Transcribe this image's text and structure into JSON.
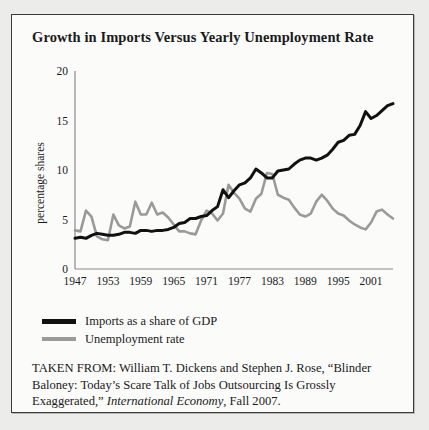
{
  "figure": {
    "title": "Growth in Imports Versus Yearly Unemployment Rate",
    "frame_border_color": "#3a3a3c",
    "background_color": "#fbfbfa",
    "page_background_color": "#ececea"
  },
  "legend": {
    "position": "below-plot",
    "items": [
      {
        "label": "Imports as a share of GDP",
        "color": "#111111",
        "style": "thick"
      },
      {
        "label": "Unemployment rate",
        "color": "#9a9a9a",
        "style": "normal"
      }
    ]
  },
  "source_note": {
    "prefix": "TAKEN FROM: William T. Dickens and Stephen J. Rose, “Blinder Baloney: Today’s Scare Talk of Jobs Outsourcing Is Grossly Exaggerated,” ",
    "italic": "International Economy",
    "suffix": ", Fall 2007."
  },
  "chart_data": {
    "type": "line",
    "title": "Growth in Imports Versus Yearly Unemployment Rate",
    "xlabel": "",
    "ylabel": "percentage shares",
    "xlim": [
      1947,
      2005
    ],
    "ylim": [
      0,
      20
    ],
    "yticks": [
      0,
      5,
      10,
      15,
      20
    ],
    "ytick_labels": [
      "0",
      "5",
      "10",
      "15",
      "20"
    ],
    "xticks": [
      1947,
      1953,
      1959,
      1965,
      1971,
      1977,
      1983,
      1989,
      1995,
      2001
    ],
    "xtick_labels": [
      "1947",
      "1953",
      "1959",
      "1965",
      "1971",
      "1977",
      "1983",
      "1989",
      "1995",
      "2001"
    ],
    "grid": false,
    "legend_position": "below",
    "x": [
      1947,
      1948,
      1949,
      1950,
      1951,
      1952,
      1953,
      1954,
      1955,
      1956,
      1957,
      1958,
      1959,
      1960,
      1961,
      1962,
      1963,
      1964,
      1965,
      1966,
      1967,
      1968,
      1969,
      1970,
      1971,
      1972,
      1973,
      1974,
      1975,
      1976,
      1977,
      1978,
      1979,
      1980,
      1981,
      1982,
      1983,
      1984,
      1985,
      1986,
      1987,
      1988,
      1989,
      1990,
      1991,
      1992,
      1993,
      1994,
      1995,
      1996,
      1997,
      1998,
      1999,
      2000,
      2001,
      2002,
      2003,
      2004,
      2005
    ],
    "series": [
      {
        "name": "Imports as a share of GDP",
        "color": "#111111",
        "values": [
          3.1,
          3.2,
          3.1,
          3.4,
          3.6,
          3.5,
          3.4,
          3.4,
          3.5,
          3.7,
          3.7,
          3.6,
          3.9,
          3.9,
          3.8,
          3.9,
          3.9,
          4.0,
          4.2,
          4.6,
          4.7,
          5.1,
          5.1,
          5.3,
          5.4,
          5.9,
          6.3,
          8.0,
          7.2,
          7.9,
          8.5,
          8.7,
          9.2,
          10.1,
          9.7,
          9.2,
          9.2,
          9.9,
          10.0,
          10.1,
          10.6,
          11.0,
          11.2,
          11.2,
          11.0,
          11.2,
          11.5,
          12.1,
          12.8,
          13.0,
          13.5,
          13.6,
          14.5,
          15.9,
          15.2,
          15.5,
          16.0,
          16.5,
          16.7
        ]
      },
      {
        "name": "Unemployment rate",
        "color": "#9a9a9a",
        "values": [
          3.9,
          3.8,
          5.9,
          5.3,
          3.3,
          3.0,
          2.9,
          5.5,
          4.4,
          4.1,
          4.3,
          6.8,
          5.5,
          5.5,
          6.7,
          5.5,
          5.7,
          5.2,
          4.5,
          3.8,
          3.8,
          3.6,
          3.5,
          4.9,
          5.9,
          5.6,
          4.9,
          5.6,
          8.5,
          7.7,
          7.1,
          6.1,
          5.8,
          7.1,
          7.6,
          9.7,
          9.6,
          7.5,
          7.2,
          7.0,
          6.2,
          5.5,
          5.3,
          5.6,
          6.8,
          7.5,
          6.9,
          6.1,
          5.6,
          5.4,
          4.9,
          4.5,
          4.2,
          4.0,
          4.7,
          5.8,
          6.0,
          5.5,
          5.1
        ]
      }
    ]
  }
}
